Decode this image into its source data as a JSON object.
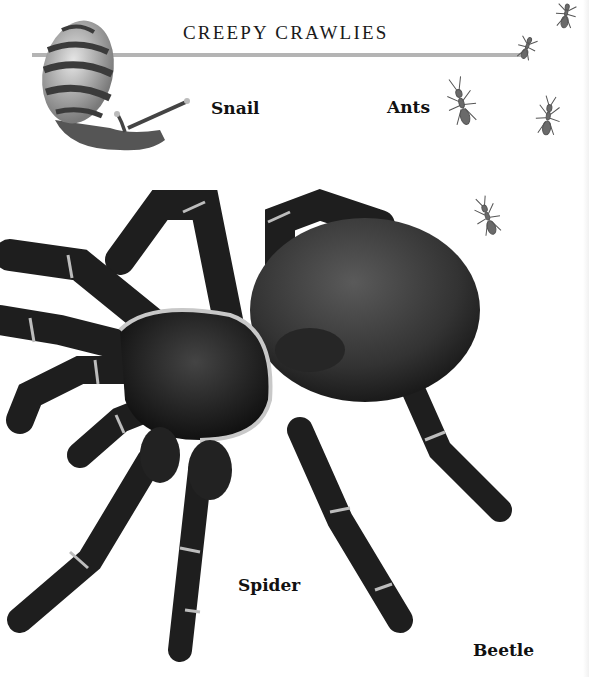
{
  "page": {
    "title": "CREEPY CRAWLIES",
    "labels": {
      "snail": "Snail",
      "ants": "Ants",
      "spider": "Spider",
      "beetle": "Beetle"
    },
    "illustrations": [
      "snail-illustration",
      "ant-illustration",
      "spider-illustration"
    ],
    "colors": {
      "background": "#ffffff",
      "rule": "#b4b4b4",
      "text": "#111111",
      "spider_body": "#1e1e1e",
      "spider_abdomen": "#3c3c3c",
      "leg_band": "#bdbdbd"
    }
  }
}
